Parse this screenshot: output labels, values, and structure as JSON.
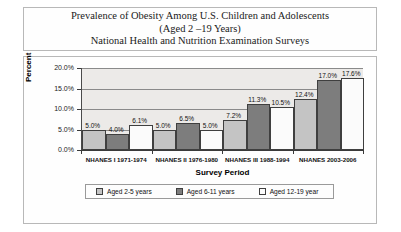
{
  "title": {
    "line1": "Prevalence of Obesity Among U.S. Children and Adolescents",
    "line2": "(Aged 2 –19 Years)",
    "line3": "National Health and Nutrition Examination Surveys"
  },
  "colors": {
    "series1": "#c4c4c4",
    "series2": "#7d7d7d",
    "series3": "#fbfbfb",
    "plot_background": "#eceae8",
    "gridline": "#8a8a8a",
    "axis": "#3a3a3a",
    "border": "#b8b8b8"
  },
  "chart_data": {
    "type": "bar",
    "title": "Prevalence of Obesity Among U.S. Children and Adolescents (Aged 2 –19 Years) National Health and Nutrition Examination Surveys",
    "xlabel": "Survey Period",
    "ylabel": "Percent",
    "ylim": [
      0,
      20
    ],
    "ytick_labels": [
      "20.0%",
      "15.0%",
      "10.0%",
      "5.0%",
      "0.0%"
    ],
    "ytick_values": [
      20,
      15,
      10,
      5,
      0
    ],
    "grid": true,
    "legend_position": "bottom",
    "categories": [
      "NHANES I 1971-1974",
      "NHANES II 1976-1980",
      "NHANES III 1988-1994",
      "NHANES 2003-2006"
    ],
    "series": [
      {
        "name": "Aged 2-5  years",
        "values": [
          5.0,
          5.0,
          7.2,
          12.4
        ],
        "labels": [
          "5.0%",
          "5.0%",
          "7.2%",
          "12.4%"
        ],
        "color": "#c4c4c4"
      },
      {
        "name": "Aged 6-11 years",
        "values": [
          4.0,
          6.5,
          11.3,
          17.0
        ],
        "labels": [
          "4.0%",
          "6.5%",
          "11.3%",
          "17.0%"
        ],
        "color": "#7d7d7d"
      },
      {
        "name": "Aged  12-19 year",
        "values": [
          6.1,
          5.0,
          10.5,
          17.6
        ],
        "labels": [
          "6.1%",
          "5.0%",
          "10.5%",
          "17.6%"
        ],
        "color": "#fbfbfb"
      }
    ]
  }
}
